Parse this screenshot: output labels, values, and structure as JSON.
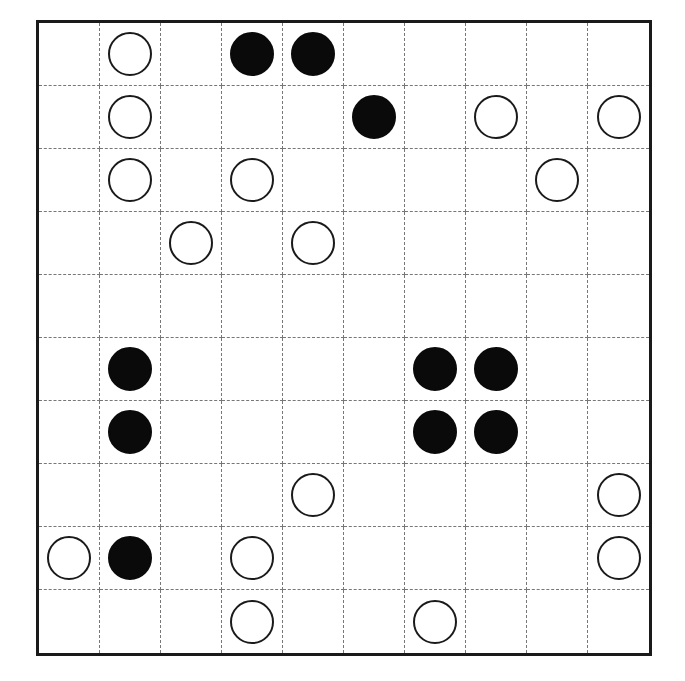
{
  "puzzle": {
    "rows": 10,
    "cols": 10,
    "colors": {
      "white_fill": "#ffffff",
      "black_fill": "#0a0a0a",
      "outline": "#1a1a1a",
      "grid_line": "#777777"
    },
    "grid": [
      [
        ".",
        "W",
        ".",
        "B",
        "B",
        ".",
        ".",
        ".",
        ".",
        "."
      ],
      [
        ".",
        "W",
        ".",
        ".",
        ".",
        "B",
        ".",
        "W",
        ".",
        "W"
      ],
      [
        ".",
        "W",
        ".",
        "W",
        ".",
        ".",
        ".",
        ".",
        "W",
        "."
      ],
      [
        ".",
        ".",
        "W",
        ".",
        "W",
        ".",
        ".",
        ".",
        ".",
        "."
      ],
      [
        ".",
        ".",
        ".",
        ".",
        ".",
        ".",
        ".",
        ".",
        ".",
        "."
      ],
      [
        ".",
        "B",
        ".",
        ".",
        ".",
        ".",
        "B",
        "B",
        ".",
        "."
      ],
      [
        ".",
        "B",
        ".",
        ".",
        ".",
        ".",
        "B",
        "B",
        ".",
        "."
      ],
      [
        ".",
        ".",
        ".",
        ".",
        "W",
        ".",
        ".",
        ".",
        ".",
        "W"
      ],
      [
        "W",
        "B",
        ".",
        "W",
        ".",
        ".",
        ".",
        ".",
        ".",
        "W"
      ],
      [
        ".",
        ".",
        ".",
        "W",
        ".",
        ".",
        "W",
        ".",
        ".",
        "."
      ]
    ],
    "legend": {
      "W": "white-circle",
      "B": "black-circle",
      ".": "empty"
    }
  }
}
